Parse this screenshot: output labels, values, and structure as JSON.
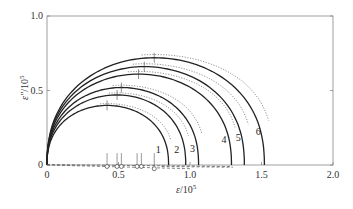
{
  "chart_data": {
    "type": "line",
    "title": "",
    "xlabel": "ε/10^5",
    "ylabel": "ε''/10^5",
    "xlim": [
      0,
      2.0
    ],
    "ylim": [
      0,
      1.0
    ],
    "xticks": [
      "0",
      "0.5",
      "1.0",
      "1.5",
      "2.0"
    ],
    "yticks": [
      "0",
      "0.5",
      "1.0"
    ],
    "grid": false,
    "legend": "none; curves labeled 1-6 near their right ends",
    "series": [
      {
        "name": "1",
        "eps_inf": 0.0,
        "eps_s": 0.85,
        "peak": 0.4,
        "peak_x": 0.42
      },
      {
        "name": "2",
        "eps_inf": 0.0,
        "eps_s": 0.97,
        "peak": 0.47,
        "peak_x": 0.49
      },
      {
        "name": "3",
        "eps_inf": 0.0,
        "eps_s": 1.06,
        "peak": 0.52,
        "peak_x": 0.52
      },
      {
        "name": "4",
        "eps_inf": 0.0,
        "eps_s": 1.29,
        "peak": 0.61,
        "peak_x": 0.64
      },
      {
        "name": "5",
        "eps_inf": 0.0,
        "eps_s": 1.38,
        "peak": 0.66,
        "peak_x": 0.68
      },
      {
        "name": "6",
        "eps_inf": 0.0,
        "eps_s": 1.52,
        "peak": 0.72,
        "peak_x": 0.75
      }
    ],
    "fitted_dotted_curves": true,
    "baseline_markers_x": [
      0.42,
      0.49,
      0.52,
      0.63,
      0.66,
      0.75
    ],
    "annotations": [
      "1",
      "2",
      "3",
      "4",
      "5",
      "6"
    ]
  },
  "axes": {
    "x_label_main": "ε",
    "x_label_rest": "/10",
    "x_label_exp": "5",
    "y_label_main": "ε''",
    "y_label_rest": "/10",
    "y_label_exp": "5"
  }
}
